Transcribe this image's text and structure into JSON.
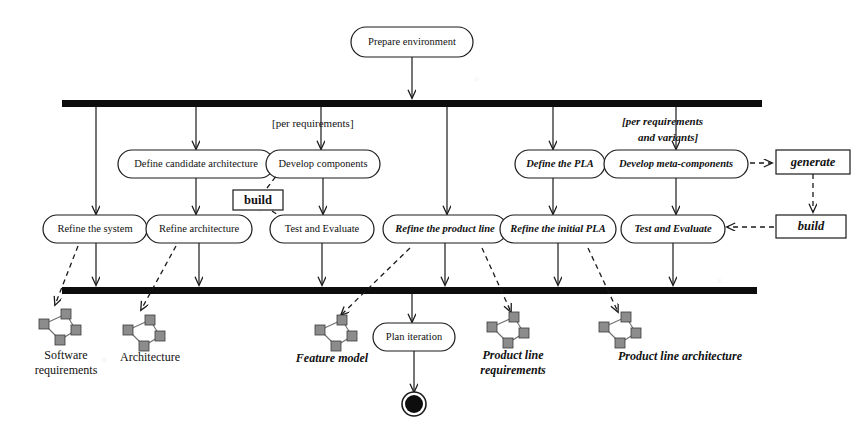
{
  "diagram": {
    "type": "uml-activity-diagram",
    "colors": {
      "ink": "#1a1a1a",
      "bar": "#0d0d0d",
      "artifact_node": "#8c8c8c",
      "background": "#ffffff"
    }
  },
  "start_activity": {
    "label": "Prepare environment"
  },
  "fork_bar": {
    "label": "fork-bar"
  },
  "join_bar": {
    "label": "join-bar"
  },
  "guards": [
    {
      "id": "guard-left",
      "lines": [
        "[per requirements]"
      ],
      "style": "upright"
    },
    {
      "id": "guard-right",
      "lines": [
        "[per requirements",
        "and variants]"
      ],
      "style": "italic"
    }
  ],
  "row_upper": [
    {
      "id": "define-candidate-architecture",
      "label": "Define candidate architecture",
      "style": "upright"
    },
    {
      "id": "develop-components",
      "label": "Develop components",
      "style": "upright"
    },
    {
      "id": "define-the-pla",
      "label": "Define the PLA",
      "style": "italic"
    },
    {
      "id": "develop-meta-components",
      "label": "Develop meta-components",
      "style": "italic"
    }
  ],
  "row_lower": [
    {
      "id": "refine-the-system",
      "label": "Refine the system",
      "style": "upright"
    },
    {
      "id": "refine-architecture",
      "label": "Refine architecture",
      "style": "upright"
    },
    {
      "id": "test-and-evaluate-left",
      "label": "Test and Evaluate",
      "style": "upright"
    },
    {
      "id": "refine-the-product-line",
      "label": "Refine the product line",
      "style": "italic"
    },
    {
      "id": "refine-the-initial-pla",
      "label": "Refine the initial PLA",
      "style": "italic"
    },
    {
      "id": "test-and-evaluate-right",
      "label": "Test and Evaluate",
      "style": "italic"
    }
  ],
  "notes": [
    {
      "id": "build-left",
      "label": "build",
      "style": "upright"
    },
    {
      "id": "generate",
      "label": "generate",
      "style": "italic"
    },
    {
      "id": "build-right",
      "label": "build",
      "style": "italic"
    }
  ],
  "artifacts": [
    {
      "id": "software-requirements",
      "lines": [
        "Software",
        "requirements"
      ],
      "style": "upright"
    },
    {
      "id": "architecture",
      "lines": [
        "Architecture"
      ],
      "style": "upright"
    },
    {
      "id": "feature-model",
      "lines": [
        "Feature model"
      ],
      "style": "italic"
    },
    {
      "id": "product-line-requirements",
      "lines": [
        "Product line",
        "requirements"
      ],
      "style": "italic"
    },
    {
      "id": "product-line-architecture",
      "lines": [
        "Product line architecture"
      ],
      "style": "italic"
    }
  ],
  "plan_activity": {
    "label": "Plan iteration"
  },
  "final_node": {
    "label": "final-node"
  }
}
